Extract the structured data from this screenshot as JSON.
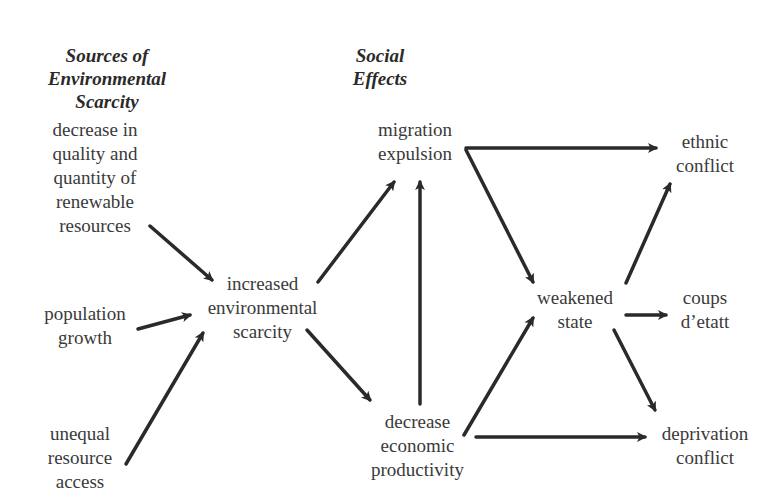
{
  "diagram": {
    "headings": {
      "sources": [
        "Sources of",
        "Environmental",
        "Scarcity"
      ],
      "social": [
        "Social",
        "Effects"
      ]
    },
    "nodes": {
      "decrease_quality": [
        "decrease in",
        "quality and",
        "quantity of",
        "renewable",
        "resources"
      ],
      "population_growth": [
        "population",
        "growth"
      ],
      "unequal_access": [
        "unequal",
        "resource",
        "access"
      ],
      "increased_scarcity": [
        "increased",
        "environmental",
        "scarcity"
      ],
      "migration": [
        "migration",
        "expulsion"
      ],
      "decrease_productivity": [
        "decrease",
        "economic",
        "productivity"
      ],
      "weakened_state": [
        "weakened",
        "state"
      ],
      "ethnic_conflict": [
        "ethnic",
        "conflict"
      ],
      "coups": [
        "coups",
        "d’etatt"
      ],
      "deprivation_conflict": [
        "deprivation",
        "conflict"
      ]
    },
    "edges": [
      {
        "from": "decrease_quality",
        "to": "increased_scarcity"
      },
      {
        "from": "population_growth",
        "to": "increased_scarcity"
      },
      {
        "from": "unequal_access",
        "to": "increased_scarcity"
      },
      {
        "from": "increased_scarcity",
        "to": "migration"
      },
      {
        "from": "increased_scarcity",
        "to": "decrease_productivity"
      },
      {
        "from": "decrease_productivity",
        "to": "migration"
      },
      {
        "from": "migration",
        "to": "ethnic_conflict"
      },
      {
        "from": "migration",
        "to": "weakened_state"
      },
      {
        "from": "decrease_productivity",
        "to": "weakened_state"
      },
      {
        "from": "decrease_productivity",
        "to": "deprivation_conflict"
      },
      {
        "from": "weakened_state",
        "to": "ethnic_conflict"
      },
      {
        "from": "weakened_state",
        "to": "coups"
      },
      {
        "from": "weakened_state",
        "to": "deprivation_conflict"
      }
    ],
    "colors": {
      "arrow": "#2a2a2a",
      "text": "#3a3a3a"
    }
  }
}
